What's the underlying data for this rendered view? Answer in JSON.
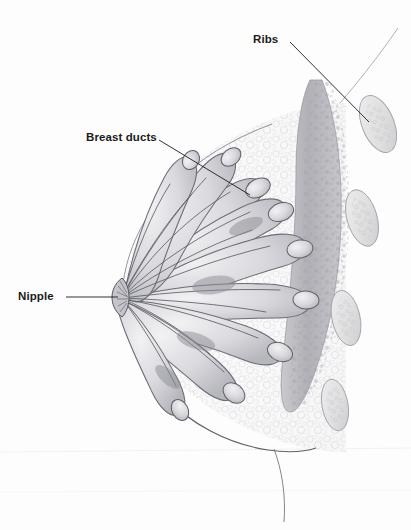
{
  "figure": {
    "kind": "medical-illustration",
    "background_color": "#fdfdfd",
    "line_color": "#1b1b1b",
    "width": 411,
    "height": 530
  },
  "labels": [
    {
      "id": "ribs",
      "text": "Ribs",
      "x": 253,
      "y": 34,
      "leader": {
        "from_x": 290,
        "from_y": 42,
        "to_x": 369,
        "to_y": 122
      }
    },
    {
      "id": "breast-ducts",
      "text": "Breast ducts",
      "x": 86,
      "y": 132,
      "leader": {
        "from_x": 159,
        "from_y": 140,
        "to_x": 250,
        "to_y": 195
      }
    },
    {
      "id": "nipple",
      "text": "Nipple",
      "x": 18,
      "y": 291,
      "leader": {
        "from_x": 66,
        "from_y": 297,
        "to_x": 118,
        "to_y": 297
      }
    }
  ],
  "anatomy": {
    "skin_contour": {
      "name": "chest-and-breast-skin-contour",
      "stroke": "#8a8a90"
    },
    "breast_outline": {
      "name": "breast-tissue-outline",
      "stroke": "#6f6f76",
      "fill": "#fbfbfb"
    },
    "nipple": {
      "name": "nipple",
      "cx": 122,
      "cy": 297,
      "description": "duct convergence point at left apex of breast"
    },
    "ducts": {
      "name": "breast-ducts-and-lobules",
      "count": 13,
      "stroke": "#6a6a72",
      "fill": "#dcdce0",
      "description": "radiating ducts from nipple terminating in bulbous lobules"
    },
    "pectoral_muscle": {
      "name": "pectoralis-muscle",
      "fill": "#b8b8bc",
      "stroke": "#9a9aa2"
    },
    "ribs": {
      "name": "rib-cross-sections",
      "count": 4,
      "fill": "#e3e3e6",
      "stroke": "#a6a6ad",
      "positions": [
        {
          "cx": 378,
          "cy": 124,
          "rx": 16,
          "ry": 30,
          "rotate": -22
        },
        {
          "cx": 362,
          "cy": 218,
          "rx": 15,
          "ry": 29,
          "rotate": -16
        },
        {
          "cx": 346,
          "cy": 318,
          "rx": 14,
          "ry": 28,
          "rotate": -12
        },
        {
          "cx": 335,
          "cy": 405,
          "rx": 13,
          "ry": 26,
          "rotate": -10
        }
      ]
    },
    "glandular_tissue": {
      "name": "fatty-glandular-tissue",
      "stroke": "#d2d2d8",
      "description": "faint cloudy stippled texture filling the breast interior"
    }
  }
}
